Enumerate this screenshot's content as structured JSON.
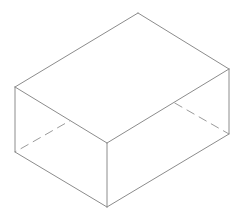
{
  "figure": {
    "type": "isometric-line-drawing",
    "background_color": "#ffffff",
    "visible_edge_color": "#8c8c8c",
    "hidden_edge_color": "#9b9b9b",
    "stroke_width": 1,
    "hidden_edge_dash": "9 5",
    "canvas": {
      "width": 244,
      "height": 215
    }
  },
  "geometry": {
    "vertex_labels": {
      "top_back": "T",
      "top_left": "L",
      "top_right": "R",
      "top_front": "F",
      "bottom_back_hidden": "H",
      "bottom_left": "BL",
      "bottom_right": "BR",
      "bottom_front": "BF"
    },
    "vertices": {
      "top_back": {
        "x": 138,
        "y": 13
      },
      "top_left": {
        "x": 15,
        "y": 87
      },
      "top_right": {
        "x": 229,
        "y": 69
      },
      "top_front": {
        "x": 107,
        "y": 143
      },
      "bottom_back_hidden": {
        "x": 138,
        "y": 82
      },
      "bottom_left": {
        "x": 15,
        "y": 152
      },
      "bottom_right": {
        "x": 229,
        "y": 134
      },
      "bottom_front": {
        "x": 107,
        "y": 207
      }
    },
    "top_face_path": "M 138 13 L 15 87 L 107 143 L 229 69 Z",
    "visible_edges": [
      {
        "name": "top-rim-back-left",
        "x1": 138,
        "y1": 13,
        "x2": 15,
        "y2": 87
      },
      {
        "name": "top-rim-left-front",
        "x1": 15,
        "y1": 87,
        "x2": 107,
        "y2": 143
      },
      {
        "name": "top-rim-front-right",
        "x1": 107,
        "y1": 143,
        "x2": 229,
        "y2": 69
      },
      {
        "name": "top-rim-right-back",
        "x1": 229,
        "y1": 69,
        "x2": 138,
        "y2": 13
      },
      {
        "name": "vertical-left",
        "x1": 15,
        "y1": 87,
        "x2": 15,
        "y2": 152
      },
      {
        "name": "vertical-front",
        "x1": 107,
        "y1": 143,
        "x2": 107,
        "y2": 207
      },
      {
        "name": "vertical-right",
        "x1": 229,
        "y1": 69,
        "x2": 229,
        "y2": 134
      },
      {
        "name": "bottom-left-front",
        "x1": 15,
        "y1": 152,
        "x2": 107,
        "y2": 207
      },
      {
        "name": "bottom-front-right",
        "x1": 107,
        "y1": 207,
        "x2": 229,
        "y2": 134
      }
    ],
    "hidden_edges": [
      {
        "name": "vertical-back-hidden",
        "x1": 138,
        "y1": 13,
        "x2": 138,
        "y2": 82
      },
      {
        "name": "bottom-back-left-hidden",
        "x1": 138,
        "y1": 82,
        "x2": 15,
        "y2": 152
      },
      {
        "name": "bottom-back-right-hidden",
        "x1": 138,
        "y1": 82,
        "x2": 229,
        "y2": 134
      }
    ]
  }
}
